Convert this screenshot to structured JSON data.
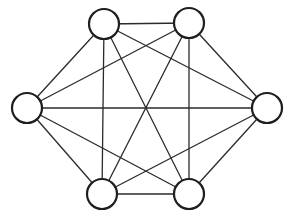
{
  "diagram": {
    "type": "complete-graph",
    "colors": {
      "background": "#ffffff",
      "stroke": "#1e1e1e",
      "node_fill": "#ffffff"
    },
    "node_radius": 15,
    "nodes": [
      {
        "id": "top-left",
        "x": 104,
        "y": 24
      },
      {
        "id": "top-right",
        "x": 189,
        "y": 23
      },
      {
        "id": "left",
        "x": 27,
        "y": 108
      },
      {
        "id": "right",
        "x": 267,
        "y": 108
      },
      {
        "id": "bottom-left",
        "x": 102,
        "y": 194
      },
      {
        "id": "bottom-right",
        "x": 189,
        "y": 194
      }
    ],
    "edges": [
      [
        "top-left",
        "top-right"
      ],
      [
        "top-left",
        "left"
      ],
      [
        "top-left",
        "right"
      ],
      [
        "top-left",
        "bottom-left"
      ],
      [
        "top-left",
        "bottom-right"
      ],
      [
        "top-right",
        "left"
      ],
      [
        "top-right",
        "right"
      ],
      [
        "top-right",
        "bottom-left"
      ],
      [
        "top-right",
        "bottom-right"
      ],
      [
        "left",
        "right"
      ],
      [
        "left",
        "bottom-left"
      ],
      [
        "left",
        "bottom-right"
      ],
      [
        "right",
        "bottom-left"
      ],
      [
        "right",
        "bottom-right"
      ],
      [
        "bottom-left",
        "bottom-right"
      ]
    ]
  }
}
